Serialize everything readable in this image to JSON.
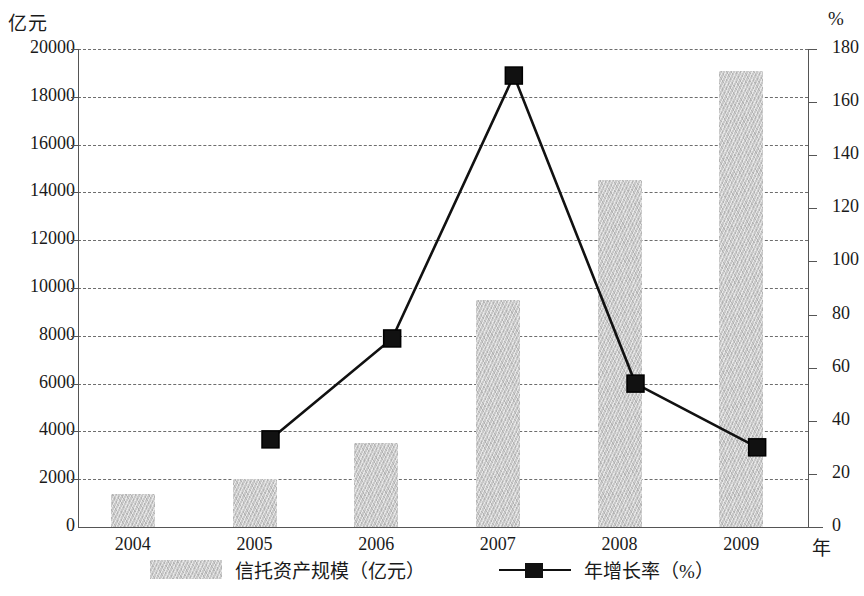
{
  "chart_data": {
    "type": "bar",
    "title": "",
    "categories": [
      "2004",
      "2005",
      "2006",
      "2007",
      "2008",
      "2009"
    ],
    "xlabel": "年",
    "ylabel": "亿元",
    "y2label": "%",
    "ylim": [
      0,
      20000
    ],
    "y2lim": [
      0,
      180
    ],
    "grid": true,
    "legend_position": "bottom",
    "y_ticks": [
      "0",
      "2000",
      "4000",
      "6000",
      "8000",
      "10000",
      "12000",
      "14000",
      "16000",
      "18000",
      "20000"
    ],
    "y2_ticks": [
      "0",
      "20",
      "40",
      "60",
      "80",
      "100",
      "120",
      "140",
      "160",
      "180"
    ],
    "series": [
      {
        "name": "信托资产规模（亿元）",
        "type": "bar",
        "axis": "left",
        "color": "#c9c9c9",
        "values": [
          1400,
          2000,
          3500,
          9500,
          14500,
          19100
        ]
      },
      {
        "name": "年增长率（%）",
        "type": "line",
        "axis": "right",
        "color": "#111111",
        "marker": "square",
        "values": [
          null,
          33,
          71,
          170,
          54,
          30
        ]
      }
    ]
  },
  "axes": {
    "left_unit_label": "亿元",
    "right_unit_label": "%",
    "x_unit_label": "年"
  },
  "legend": {
    "items": [
      {
        "label": "信托资产规模（亿元）",
        "marker": "bar-swatch"
      },
      {
        "label": "年增长率（%）",
        "marker": "line-square"
      }
    ]
  }
}
